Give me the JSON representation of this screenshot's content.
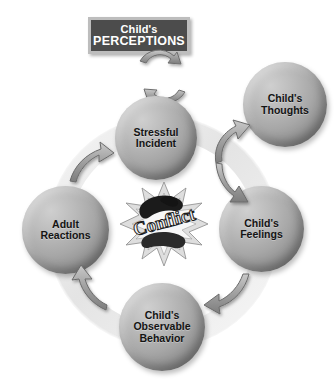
{
  "diagram": {
    "title_box": {
      "line1": "Child's",
      "line2": "PERCEPTIONS",
      "fill_color": "#4c4c4c",
      "border_color": "#bdbdbd",
      "text_color": "#ffffff"
    },
    "center": {
      "label": "Conflict",
      "icon": "explosion-burst-icon"
    },
    "ring": {
      "color": "#e9e9e9",
      "flow_direction": "counter-clockwise"
    },
    "nodes": [
      {
        "id": "stressful-incident",
        "line1": "Stressful",
        "line2": "Incident",
        "line3": ""
      },
      {
        "id": "childs-thoughts",
        "line1": "Child's",
        "line2": "Thoughts",
        "line3": ""
      },
      {
        "id": "childs-feelings",
        "line1": "Child's",
        "line2": "Feelings",
        "line3": ""
      },
      {
        "id": "observable-behavior",
        "line1": "Child's",
        "line2": "Observable",
        "line3": "Behavior"
      },
      {
        "id": "adult-reactions",
        "line1": "Adult",
        "line2": "Reactions",
        "line3": ""
      }
    ],
    "connectors": [
      {
        "id": "perceptions-loop",
        "type": "double-circular-arrow"
      },
      {
        "id": "incident-to-thoughts",
        "type": "double-curved-arrow"
      },
      {
        "id": "feelings-to-behavior",
        "type": "curved-arrow"
      },
      {
        "id": "behavior-to-adult-reactions",
        "type": "curved-arrow"
      },
      {
        "id": "adult-reactions-to-incident",
        "type": "curved-arrow"
      }
    ],
    "sphere_color": "#a7a7a7",
    "arrow_color": "#9a9a9a"
  }
}
